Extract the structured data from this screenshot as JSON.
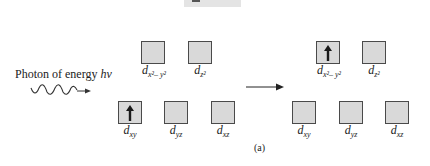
{
  "photon": {
    "label_prefix": "Photon of energy ",
    "label_symbol": "hν"
  },
  "before": {
    "upper": [
      {
        "id": "dx2y2",
        "base": "d",
        "sub": "x²– y²",
        "electron": false
      },
      {
        "id": "dz2",
        "base": "d",
        "sub": "z²",
        "electron": false
      }
    ],
    "lower": [
      {
        "id": "dxy",
        "base": "d",
        "sub": "xy",
        "electron": true
      },
      {
        "id": "dyz",
        "base": "d",
        "sub": "yz",
        "electron": false
      },
      {
        "id": "dxz",
        "base": "d",
        "sub": "xz",
        "electron": false
      }
    ]
  },
  "after": {
    "upper": [
      {
        "id": "dx2y2",
        "base": "d",
        "sub": "x²– y²",
        "electron": true
      },
      {
        "id": "dz2",
        "base": "d",
        "sub": "z²",
        "electron": false
      }
    ],
    "lower": [
      {
        "id": "dxy",
        "base": "d",
        "sub": "xy",
        "electron": false
      },
      {
        "id": "dyz",
        "base": "d",
        "sub": "yz",
        "electron": false
      },
      {
        "id": "dxz",
        "base": "d",
        "sub": "xz",
        "electron": false
      }
    ]
  },
  "caption": "(a)",
  "colors": {
    "orbital_fill": "#d9d9d9",
    "orbital_border": "#4a4a4a",
    "electron_arrow": "#1a1a1a"
  }
}
